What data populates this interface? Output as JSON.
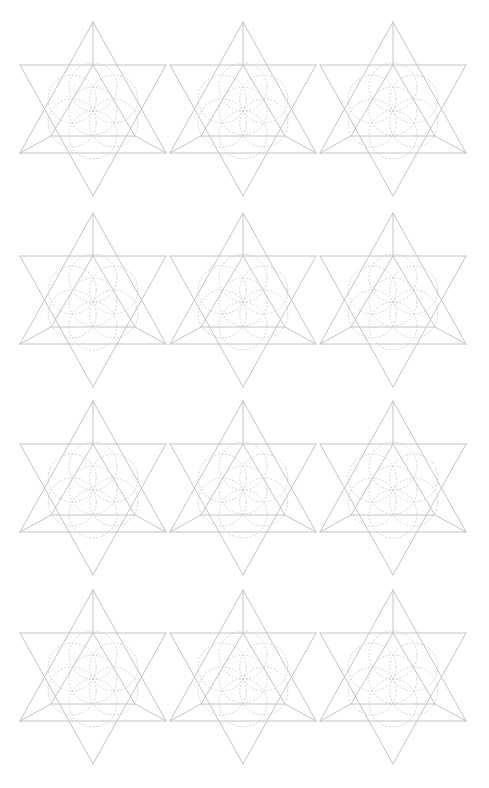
{
  "page": {
    "width": 489,
    "height": 788,
    "background": "#ffffff"
  },
  "style": {
    "line_color": "#c4c4c4",
    "circle_color": "#cfcfcf"
  },
  "grid": {
    "columns": 3,
    "rows": 4,
    "column_centers_x": [
      93,
      243,
      393
    ],
    "row_apex_y": [
      22,
      213,
      401,
      590
    ]
  },
  "motif": {
    "name": "star-tetrahedron-with-seed-of-life",
    "half_width": 73,
    "apex_offset": 87,
    "upper_bar_offset": 44,
    "lower_bar_offset": 44,
    "inner_base_offset": 27,
    "inner_half_width": 42,
    "circle_radius": 24,
    "circle_center_offset": 2,
    "circle_count": 7
  }
}
